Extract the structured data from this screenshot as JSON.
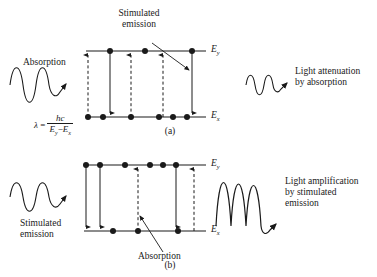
{
  "figure": {
    "caption_a": "(a)",
    "caption_b": "(b)",
    "level_upper_label": "E",
    "level_upper_sub": "y",
    "level_lower_label": "E",
    "level_lower_sub": "x",
    "formula": {
      "lhs": "λ",
      "equals": "=",
      "numerator": "hc",
      "denominator_e1": "E",
      "denominator_e1_sub": "y",
      "denominator_minus": "−",
      "denominator_e2": "E",
      "denominator_e2_sub": "x"
    },
    "colors": {
      "ink": "#1a1a1a",
      "background": "#ffffff"
    }
  },
  "panel_a": {
    "name": "absorption-dominant",
    "label_left": "Absorption",
    "label_callout": "Stimulated\nemission",
    "label_callout_line1": "Stimulated",
    "label_callout_line2": "emission",
    "label_right_line1": "Light attenuation",
    "label_right_line2": "by absorption",
    "input_wave": {
      "cycles": 2.5,
      "amplitude": 13
    },
    "output_wave": {
      "cycles": 2.5,
      "amplitude": 7
    },
    "upper_level_electrons": 3,
    "lower_level_electrons": 6,
    "transitions": [
      {
        "type": "absorption",
        "direction": "up",
        "style": "dashed"
      },
      {
        "type": "stimulated-emission",
        "direction": "down",
        "style": "solid"
      },
      {
        "type": "absorption",
        "direction": "up",
        "style": "dashed"
      },
      {
        "type": "absorption",
        "direction": "up",
        "style": "dashed"
      },
      {
        "type": "stimulated-emission",
        "direction": "down",
        "style": "solid"
      }
    ]
  },
  "panel_b": {
    "name": "stimulated-emission-dominant",
    "label_left_line1": "Stimulated",
    "label_left_line2": "emission",
    "label_callout": "Absorption",
    "label_right_line1": "Light amplification",
    "label_right_line2": "by stimulated",
    "label_right_line3": "emission",
    "input_wave": {
      "cycles": 2.5,
      "amplitude": 11
    },
    "output_wave": {
      "cycles": 2.5,
      "amplitude": 22
    },
    "upper_level_electrons": 6,
    "lower_level_electrons": 3,
    "transitions": [
      {
        "type": "stimulated-emission",
        "direction": "down",
        "style": "solid"
      },
      {
        "type": "stimulated-emission",
        "direction": "down",
        "style": "solid"
      },
      {
        "type": "absorption",
        "direction": "up",
        "style": "dashed"
      },
      {
        "type": "stimulated-emission",
        "direction": "down",
        "style": "solid"
      },
      {
        "type": "absorption",
        "direction": "up",
        "style": "dashed"
      }
    ]
  }
}
